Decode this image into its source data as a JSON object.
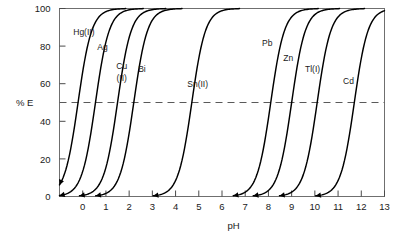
{
  "chart_data": {
    "type": "line",
    "title": "",
    "subtitle": "",
    "xlabel": "pH",
    "ylabel": "% E",
    "xlim": [
      -1,
      13
    ],
    "ylim": [
      0,
      100
    ],
    "grid": false,
    "legend_position": "inline-curve-labels",
    "x_ticks": [
      0,
      1,
      2,
      3,
      4,
      5,
      6,
      7,
      8,
      9,
      10,
      11,
      12,
      13
    ],
    "x_tick_labels": [
      "0",
      "1",
      "2",
      "3",
      "4",
      "5",
      "6",
      "7",
      "8",
      "9",
      "10",
      "11",
      "12",
      "13"
    ],
    "y_ticks": [
      0,
      20,
      40,
      60,
      80,
      100
    ],
    "y_tick_labels": [
      "0",
      "20",
      "40",
      "60",
      "80",
      "100"
    ],
    "annotations": [
      {
        "text": "50% extraction reference line",
        "type": "hline",
        "y": 50,
        "style": "dashed"
      }
    ],
    "series": [
      {
        "name": "Hg(II)",
        "label": "Hg(II)",
        "ph_half": -0.2,
        "steepness": 3.4,
        "label_x": 0.05,
        "label_y": 86,
        "points": [
          {
            "pH": -1.0,
            "E": 6
          },
          {
            "pH": -0.8,
            "E": 12
          },
          {
            "pH": -0.6,
            "E": 21
          },
          {
            "pH": -0.4,
            "E": 34
          },
          {
            "pH": -0.2,
            "E": 50
          },
          {
            "pH": 0.0,
            "E": 66
          },
          {
            "pH": 0.2,
            "E": 79
          },
          {
            "pH": 0.4,
            "E": 88
          },
          {
            "pH": 0.6,
            "E": 94
          },
          {
            "pH": 0.9,
            "E": 98
          },
          {
            "pH": 1.2,
            "E": 100
          }
        ]
      },
      {
        "name": "Ag",
        "label": "Ag",
        "ph_half": 0.55,
        "steepness": 3.4,
        "label_x": 0.85,
        "label_y": 78,
        "points": [
          {
            "pH": -1.0,
            "E": 1
          },
          {
            "pH": -0.6,
            "E": 3
          },
          {
            "pH": -0.2,
            "E": 8
          },
          {
            "pH": 0.0,
            "E": 14
          },
          {
            "pH": 0.2,
            "E": 24
          },
          {
            "pH": 0.4,
            "E": 37
          },
          {
            "pH": 0.55,
            "E": 50
          },
          {
            "pH": 0.7,
            "E": 62
          },
          {
            "pH": 0.9,
            "E": 76
          },
          {
            "pH": 1.2,
            "E": 90
          },
          {
            "pH": 1.6,
            "E": 97
          },
          {
            "pH": 2.0,
            "E": 100
          }
        ]
      },
      {
        "name": "Cu(II)",
        "label": "Cu (II)",
        "label_line1": "Cu",
        "label_line2": "(II)",
        "ph_half": 1.5,
        "steepness": 3.4,
        "label_x": 1.68,
        "label_y": 68,
        "points": [
          {
            "pH": 0.0,
            "E": 1
          },
          {
            "pH": 0.4,
            "E": 3
          },
          {
            "pH": 0.8,
            "E": 9
          },
          {
            "pH": 1.0,
            "E": 16
          },
          {
            "pH": 1.2,
            "E": 26
          },
          {
            "pH": 1.35,
            "E": 38
          },
          {
            "pH": 1.5,
            "E": 50
          },
          {
            "pH": 1.65,
            "E": 62
          },
          {
            "pH": 1.85,
            "E": 76
          },
          {
            "pH": 2.1,
            "E": 88
          },
          {
            "pH": 2.5,
            "E": 97
          },
          {
            "pH": 2.9,
            "E": 100
          }
        ]
      },
      {
        "name": "Bi",
        "label": "Bi",
        "ph_half": 2.2,
        "steepness": 3.4,
        "label_x": 2.55,
        "label_y": 66,
        "points": [
          {
            "pH": 0.8,
            "E": 1
          },
          {
            "pH": 1.2,
            "E": 3
          },
          {
            "pH": 1.5,
            "E": 9
          },
          {
            "pH": 1.7,
            "E": 16
          },
          {
            "pH": 1.9,
            "E": 26
          },
          {
            "pH": 2.05,
            "E": 38
          },
          {
            "pH": 2.2,
            "E": 50
          },
          {
            "pH": 2.35,
            "E": 62
          },
          {
            "pH": 2.55,
            "E": 76
          },
          {
            "pH": 2.8,
            "E": 88
          },
          {
            "pH": 3.2,
            "E": 97
          },
          {
            "pH": 3.6,
            "E": 100
          }
        ]
      },
      {
        "name": "Sn(II)",
        "label": "Sn(II)",
        "ph_half": 4.7,
        "steepness": 3.4,
        "label_x": 4.95,
        "label_y": 58,
        "points": [
          {
            "pH": 3.2,
            "E": 1
          },
          {
            "pH": 3.7,
            "E": 4
          },
          {
            "pH": 4.0,
            "E": 9
          },
          {
            "pH": 4.2,
            "E": 16
          },
          {
            "pH": 4.4,
            "E": 26
          },
          {
            "pH": 4.55,
            "E": 38
          },
          {
            "pH": 4.7,
            "E": 50
          },
          {
            "pH": 4.85,
            "E": 62
          },
          {
            "pH": 5.05,
            "E": 76
          },
          {
            "pH": 5.3,
            "E": 88
          },
          {
            "pH": 5.7,
            "E": 97
          },
          {
            "pH": 6.1,
            "E": 100
          }
        ]
      },
      {
        "name": "Pb",
        "label": "Pb",
        "ph_half": 8.1,
        "steepness": 3.4,
        "label_x": 7.95,
        "label_y": 80,
        "points": [
          {
            "pH": 6.6,
            "E": 1
          },
          {
            "pH": 7.1,
            "E": 4
          },
          {
            "pH": 7.4,
            "E": 9
          },
          {
            "pH": 7.6,
            "E": 16
          },
          {
            "pH": 7.8,
            "E": 26
          },
          {
            "pH": 7.95,
            "E": 38
          },
          {
            "pH": 8.1,
            "E": 50
          },
          {
            "pH": 8.25,
            "E": 62
          },
          {
            "pH": 8.45,
            "E": 76
          },
          {
            "pH": 8.7,
            "E": 88
          },
          {
            "pH": 9.1,
            "E": 97
          },
          {
            "pH": 9.5,
            "E": 100
          }
        ]
      },
      {
        "name": "Zn",
        "label": "Zn",
        "ph_half": 9.0,
        "steepness": 3.4,
        "label_x": 8.85,
        "label_y": 72,
        "points": [
          {
            "pH": 7.5,
            "E": 1
          },
          {
            "pH": 8.0,
            "E": 4
          },
          {
            "pH": 8.3,
            "E": 9
          },
          {
            "pH": 8.5,
            "E": 16
          },
          {
            "pH": 8.7,
            "E": 26
          },
          {
            "pH": 8.85,
            "E": 38
          },
          {
            "pH": 9.0,
            "E": 50
          },
          {
            "pH": 9.15,
            "E": 62
          },
          {
            "pH": 9.35,
            "E": 76
          },
          {
            "pH": 9.6,
            "E": 88
          },
          {
            "pH": 10.0,
            "E": 97
          },
          {
            "pH": 10.4,
            "E": 100
          }
        ]
      },
      {
        "name": "Tl(I)",
        "label": "Tl(I)",
        "ph_half": 10.1,
        "steepness": 3.4,
        "label_x": 9.9,
        "label_y": 66,
        "points": [
          {
            "pH": 8.6,
            "E": 1
          },
          {
            "pH": 9.1,
            "E": 4
          },
          {
            "pH": 9.4,
            "E": 9
          },
          {
            "pH": 9.6,
            "E": 16
          },
          {
            "pH": 9.8,
            "E": 26
          },
          {
            "pH": 9.95,
            "E": 38
          },
          {
            "pH": 10.1,
            "E": 50
          },
          {
            "pH": 10.25,
            "E": 62
          },
          {
            "pH": 10.45,
            "E": 76
          },
          {
            "pH": 10.7,
            "E": 88
          },
          {
            "pH": 11.1,
            "E": 97
          },
          {
            "pH": 11.5,
            "E": 100
          }
        ]
      },
      {
        "name": "Cd",
        "label": "Cd",
        "ph_half": 11.7,
        "steepness": 3.4,
        "label_x": 11.45,
        "label_y": 60,
        "points": [
          {
            "pH": 10.2,
            "E": 1
          },
          {
            "pH": 10.7,
            "E": 4
          },
          {
            "pH": 11.0,
            "E": 9
          },
          {
            "pH": 11.2,
            "E": 16
          },
          {
            "pH": 11.4,
            "E": 26
          },
          {
            "pH": 11.55,
            "E": 38
          },
          {
            "pH": 11.7,
            "E": 50
          },
          {
            "pH": 11.85,
            "E": 62
          },
          {
            "pH": 12.05,
            "E": 76
          },
          {
            "pH": 12.3,
            "E": 88
          },
          {
            "pH": 12.7,
            "E": 97
          },
          {
            "pH": 13.0,
            "E": 100
          }
        ]
      }
    ]
  }
}
